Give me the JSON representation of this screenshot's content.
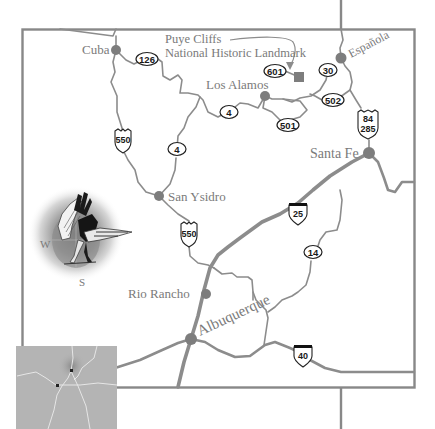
{
  "map": {
    "title": "North-Central New Mexico Area Map",
    "colors": {
      "road": "#8c8c8c",
      "frame": "#888888",
      "city": "#7d7d7d",
      "label": "#7a7a7a",
      "inset_bg": "#b4b4b4"
    },
    "cities": [
      {
        "name": "Cuba",
        "x": 116,
        "y": 50
      },
      {
        "name": "Los Alamos",
        "x": 265,
        "y": 96
      },
      {
        "name": "Española",
        "x": 341,
        "y": 58
      },
      {
        "name": "Santa Fe",
        "x": 369,
        "y": 153
      },
      {
        "name": "San Ysidro",
        "x": 159,
        "y": 196
      },
      {
        "name": "Rio Rancho",
        "x": 206,
        "y": 294
      },
      {
        "name": "Albuquerque",
        "x": 191,
        "y": 339
      }
    ],
    "landmark": {
      "name_line1": "Puye Cliffs",
      "name_line2": "National Historic Landmark",
      "x": 299,
      "y": 77
    },
    "shields": [
      {
        "type": "state",
        "label": "126",
        "x": 147,
        "y": 59
      },
      {
        "type": "state",
        "label": "601",
        "x": 275,
        "y": 71
      },
      {
        "type": "state",
        "label": "30",
        "x": 328,
        "y": 70
      },
      {
        "type": "state",
        "label": "502",
        "x": 333,
        "y": 100
      },
      {
        "type": "state",
        "label": "4",
        "x": 229,
        "y": 112
      },
      {
        "type": "state",
        "label": "501",
        "x": 288,
        "y": 125
      },
      {
        "type": "state",
        "label": "4",
        "x": 177,
        "y": 149
      },
      {
        "type": "us",
        "label": "550",
        "x": 123,
        "y": 139
      },
      {
        "type": "us",
        "label_line1": "84",
        "label_line2": "285",
        "x": 368,
        "y": 122
      },
      {
        "type": "us",
        "label": "550",
        "x": 189,
        "y": 233
      },
      {
        "type": "interstate",
        "label": "25",
        "x": 298,
        "y": 211
      },
      {
        "type": "state",
        "label": "14",
        "x": 313,
        "y": 252
      },
      {
        "type": "interstate",
        "label": "40",
        "x": 303,
        "y": 354
      }
    ],
    "compass": {
      "west_label": "W",
      "south_label": "S"
    },
    "inset": {
      "description": "New Mexico locator map",
      "markers": 2
    }
  }
}
